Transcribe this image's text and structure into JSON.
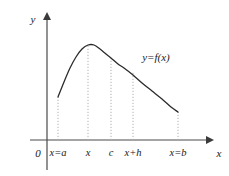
{
  "figure": {
    "background_color": "#ffffff",
    "axis_color": "#4a4a4a",
    "curve_color": "#2b2b2b",
    "dotted_color": "#b0b0b0",
    "text_color": "#1a1a1a",
    "origin_label": "0",
    "y_axis_label": "y",
    "x_axis_label": "x",
    "curve_label": "y=f(x)"
  },
  "tick_labels": [
    {
      "text": "x=a",
      "x": 58
    },
    {
      "text": "x",
      "x": 88
    },
    {
      "text": "c",
      "x": 111
    },
    {
      "text": "x+h",
      "x": 133
    },
    {
      "text": "x=b",
      "x": 178
    }
  ],
  "chart_data": {
    "type": "line",
    "title": "",
    "subtitle": "",
    "xlabel": "x",
    "ylabel": "y",
    "grid": false,
    "legend": "none",
    "annotations": [
      {
        "text": "y=f(x)",
        "x": 156,
        "y": 57,
        "role": "curve-label"
      },
      {
        "text": "0",
        "x": 38,
        "y": 155,
        "role": "origin"
      }
    ],
    "axes": {
      "x_axis_y_pixel": 140,
      "y_axis_x_pixel": 47,
      "x_axis_end_pixel": 212,
      "y_axis_top_pixel": 13,
      "arrowheads": [
        "x-positive",
        "y-positive"
      ]
    },
    "x_tick_positions": [
      58,
      88,
      111,
      133,
      178
    ],
    "x_tick_labels": [
      "x=a",
      "x",
      "c",
      "x+h",
      "x=b"
    ],
    "dropline_tops": [
      97,
      45,
      58,
      72,
      112
    ],
    "series": [
      {
        "name": "f(x)",
        "points": [
          {
            "x": 58,
            "y": 97
          },
          {
            "x": 64,
            "y": 82
          },
          {
            "x": 70,
            "y": 68
          },
          {
            "x": 76,
            "y": 57
          },
          {
            "x": 82,
            "y": 49
          },
          {
            "x": 88,
            "y": 45
          },
          {
            "x": 94,
            "y": 45
          },
          {
            "x": 100,
            "y": 49
          },
          {
            "x": 106,
            "y": 54
          },
          {
            "x": 111,
            "y": 58
          },
          {
            "x": 118,
            "y": 64
          },
          {
            "x": 124,
            "y": 68
          },
          {
            "x": 133,
            "y": 75
          },
          {
            "x": 142,
            "y": 83
          },
          {
            "x": 152,
            "y": 91
          },
          {
            "x": 162,
            "y": 99
          },
          {
            "x": 171,
            "y": 107
          },
          {
            "x": 178,
            "y": 112
          }
        ]
      }
    ]
  }
}
